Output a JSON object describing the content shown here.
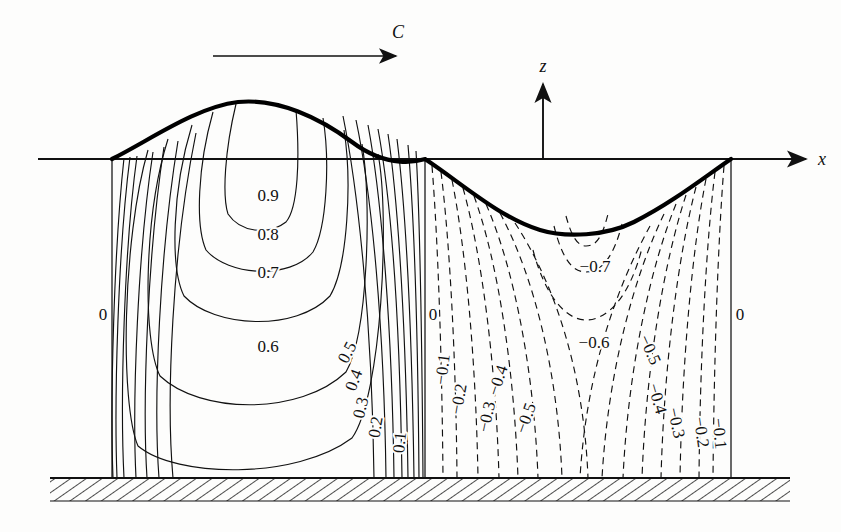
{
  "figure": {
    "axes": {
      "x_label": "x",
      "z_label": "z"
    },
    "celerity": {
      "label": "C",
      "direction": "right"
    },
    "colors": {
      "ink": "#111111",
      "surface": "#000000",
      "paper": "#fdfdfc"
    }
  },
  "labels": {
    "crest_region": [
      {
        "text": "0.9",
        "x": 268,
        "y": 201
      },
      {
        "text": "0.8",
        "x": 268,
        "y": 240
      },
      {
        "text": "0.7",
        "x": 268,
        "y": 278
      },
      {
        "text": "0.6",
        "x": 268,
        "y": 352
      },
      {
        "text": "0.5",
        "x": 352,
        "y": 355,
        "rot": -62
      },
      {
        "text": "0.4",
        "x": 359,
        "y": 382,
        "rot": -70
      },
      {
        "text": "0.3",
        "x": 366,
        "y": 409,
        "rot": -76
      },
      {
        "text": "0.2",
        "x": 381,
        "y": 428,
        "rot": -80
      },
      {
        "text": "0.1",
        "x": 405,
        "y": 443,
        "rot": -84
      }
    ],
    "trough_region": [
      {
        "text": "−0.7",
        "x": 595,
        "y": 272
      },
      {
        "text": "−0.6",
        "x": 594,
        "y": 348
      },
      {
        "text": "−0.1",
        "x": 448,
        "y": 370,
        "rot": -83
      },
      {
        "text": "−0.2",
        "x": 464,
        "y": 400,
        "rot": -80
      },
      {
        "text": "−0.3",
        "x": 492,
        "y": 418,
        "rot": -78
      },
      {
        "text": "−0.4",
        "x": 503,
        "y": 382,
        "rot": -72
      },
      {
        "text": "−0.5",
        "x": 531,
        "y": 420,
        "rot": -70
      },
      {
        "text": "−0.5",
        "x": 645,
        "y": 352,
        "rot": 66
      },
      {
        "text": "−0.4",
        "x": 652,
        "y": 400,
        "rot": 74
      },
      {
        "text": "−0.3",
        "x": 671,
        "y": 424,
        "rot": 78
      },
      {
        "text": "−0.2",
        "x": 696,
        "y": 433,
        "rot": 82
      },
      {
        "text": "−0.1",
        "x": 714,
        "y": 434,
        "rot": 84
      }
    ],
    "zero_lines": [
      {
        "text": "0",
        "x": 103,
        "y": 320
      },
      {
        "text": "0",
        "x": 433,
        "y": 320
      },
      {
        "text": "0",
        "x": 740,
        "y": 320
      }
    ]
  },
  "chart_data": {
    "type": "line",
    "xlabel": "x",
    "ylabel": "z",
    "surface": {
      "description": "free surface wave profile",
      "crest_x": 265,
      "crest_y": 102,
      "trough_x": 585,
      "trough_y": 232,
      "zero_crossings_x": [
        112,
        425,
        731
      ]
    },
    "still_water_level_y": 159,
    "bottom_y": 478,
    "contour_levels_crest": [
      0.9,
      0.8,
      0.7,
      0.6,
      0.5,
      0.4,
      0.3,
      0.2,
      0.1,
      0
    ],
    "contour_levels_trough": [
      -0.1,
      -0.2,
      -0.3,
      -0.4,
      -0.5,
      -0.6,
      -0.7,
      0
    ],
    "line_styles": {
      "positive": "solid",
      "negative": "dashed",
      "zero": "solid"
    }
  }
}
